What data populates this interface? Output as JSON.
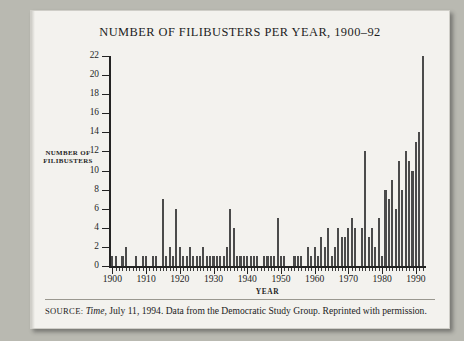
{
  "figure": {
    "title": "NUMBER OF FILIBUSTERS PER YEAR, 1900–92",
    "source_label": "SOURCE:",
    "source_italic": "Time",
    "source_rest": ", July 11, 1994. Data from the Democratic Study Group. Reprinted with permission."
  },
  "chart_data": {
    "type": "bar",
    "title": "NUMBER OF FILIBUSTERS PER YEAR, 1900–92",
    "xlabel": "YEAR",
    "ylabel": "NUMBER OF FILIBUSTERS",
    "ylabel_lines": [
      "NUMBER OF",
      "FILIBUSTERS"
    ],
    "xlim": [
      1899,
      1993
    ],
    "ylim": [
      0,
      22
    ],
    "yticks": [
      0,
      2,
      4,
      6,
      8,
      10,
      12,
      14,
      16,
      18,
      20,
      22
    ],
    "xticks": [
      1900,
      1910,
      1920,
      1930,
      1940,
      1950,
      1960,
      1970,
      1980,
      1990
    ],
    "xtick_labels": [
      "1900",
      "1910",
      "1920",
      "1930",
      "1940",
      "1950",
      "1960",
      "1970",
      "1980",
      "1990"
    ],
    "grid": false,
    "legend": false,
    "bar_color": "#4b4b4b",
    "categories": [
      1900,
      1901,
      1902,
      1903,
      1904,
      1905,
      1906,
      1907,
      1908,
      1909,
      1910,
      1911,
      1912,
      1913,
      1914,
      1915,
      1916,
      1917,
      1918,
      1919,
      1920,
      1921,
      1922,
      1923,
      1924,
      1925,
      1926,
      1927,
      1928,
      1929,
      1930,
      1931,
      1932,
      1933,
      1934,
      1935,
      1936,
      1937,
      1938,
      1939,
      1940,
      1941,
      1942,
      1943,
      1944,
      1945,
      1946,
      1947,
      1948,
      1949,
      1950,
      1951,
      1952,
      1953,
      1954,
      1955,
      1956,
      1957,
      1958,
      1959,
      1960,
      1961,
      1962,
      1963,
      1964,
      1965,
      1966,
      1967,
      1968,
      1969,
      1970,
      1971,
      1972,
      1973,
      1974,
      1975,
      1976,
      1977,
      1978,
      1979,
      1980,
      1981,
      1982,
      1983,
      1984,
      1985,
      1986,
      1987,
      1988,
      1989,
      1990,
      1991,
      1992
    ],
    "values": [
      1,
      1,
      0,
      1,
      2,
      0,
      0,
      1,
      0,
      1,
      1,
      0,
      1,
      1,
      0,
      7,
      1,
      2,
      1,
      6,
      2,
      1,
      1,
      2,
      1,
      1,
      1,
      2,
      1,
      1,
      1,
      1,
      1,
      1,
      2,
      6,
      4,
      1,
      1,
      1,
      1,
      1,
      1,
      1,
      0,
      1,
      1,
      1,
      1,
      5,
      1,
      1,
      0,
      0,
      1,
      1,
      1,
      0,
      2,
      1,
      2,
      1,
      3,
      2,
      4,
      1,
      2,
      4,
      3,
      3,
      4,
      5,
      4,
      0,
      4,
      12,
      3,
      4,
      2,
      5,
      1,
      8,
      7,
      9,
      6,
      11,
      8,
      12,
      11,
      10,
      13,
      14,
      22
    ]
  }
}
